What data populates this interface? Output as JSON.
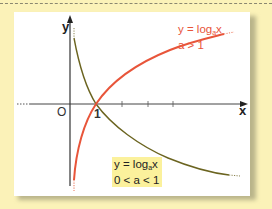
{
  "figure": {
    "background_color": "#fbf2b8",
    "panel_color": "#ffffff",
    "axes": {
      "x_label": "x",
      "y_label": "y",
      "origin_label": "O",
      "tick_label_1": "1",
      "axis_color": "#333333"
    },
    "curves": [
      {
        "name": "increasing-log",
        "color": "#e8553a",
        "equation_prefix": "y = log",
        "equation_base": "a",
        "equation_suffix": "x",
        "condition": "a > 1"
      },
      {
        "name": "decreasing-log",
        "color": "#6b6420",
        "equation_prefix": "y = log",
        "equation_base": "a",
        "equation_suffix": "x",
        "condition": "0 < a < 1",
        "label_background": "#fbf19c"
      }
    ]
  }
}
